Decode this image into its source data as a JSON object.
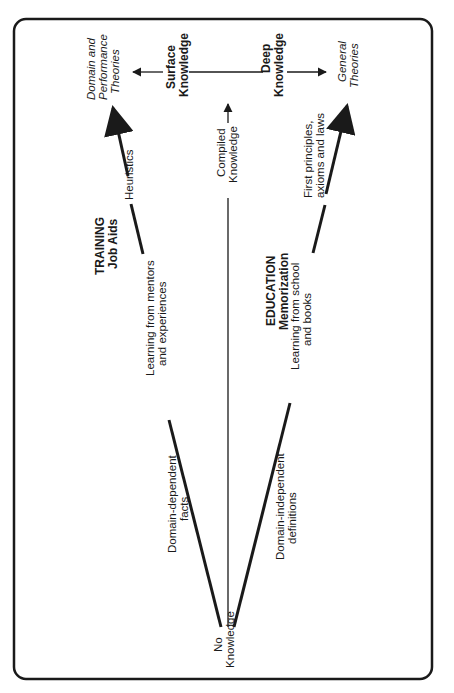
{
  "diagram": {
    "orientation": "rotated-90-ccw",
    "nodes": {
      "origin": [
        "No",
        "Knowledge"
      ],
      "domain_theories": [
        "Domain and",
        "Performance",
        "Theories"
      ],
      "general_theories": [
        "General",
        "Theories"
      ],
      "surface_knowledge": [
        "Surface",
        "Knowledge"
      ],
      "deep_knowledge": [
        "Deep",
        "Knowledge"
      ],
      "compiled_knowledge": [
        "Compiled",
        "Knowledge"
      ]
    },
    "edge_labels": {
      "domain_dependent": [
        "Domain-dependent",
        "facts"
      ],
      "mentors": [
        "Learning from mentors",
        "and experiences"
      ],
      "heuristics": "Heuristics",
      "domain_independent": [
        "Domain-independent",
        "definitions"
      ],
      "school": [
        "Learning from school",
        "and books"
      ],
      "first_principles": [
        "First principles,",
        "axioms and laws"
      ]
    },
    "branch_labels": {
      "training": [
        "TRAINING",
        "Job Aids"
      ],
      "education": [
        "EDUCATION",
        "Memorization"
      ]
    }
  }
}
